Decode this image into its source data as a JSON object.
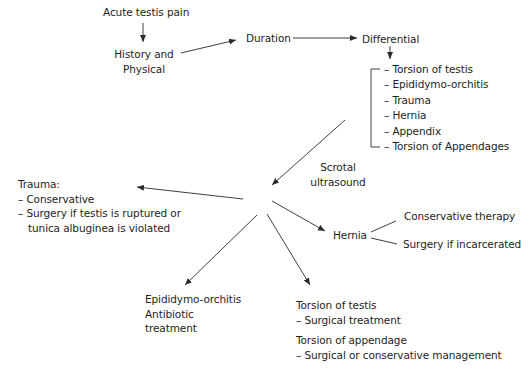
{
  "diagram": {
    "nodes": {
      "start": "Acute testis pain",
      "history_line1": "History and",
      "history_line2": "Physical",
      "duration": "Duration",
      "differential": "Differential",
      "differential_items": [
        "– Torsion of testis",
        "– Epididymo-orchitis",
        "– Trauma",
        "– Hernia",
        "– Appendix",
        "– Torsion of Appendages"
      ],
      "ultrasound_line1": "Scrotal",
      "ultrasound_line2": "ultrasound",
      "trauma": {
        "title": "Trauma:",
        "line1": "– Conservative",
        "line2": "– Surgery if testis is ruptured or",
        "line3": "tunica albuginea is violated"
      },
      "hernia": {
        "label": "Hernia",
        "option1": "Conservative therapy",
        "option2": "Surgery if incarcerated"
      },
      "epididymo": {
        "line1": "Epididymo-orchitis",
        "line2": "Antibiotic",
        "line3": "treatment"
      },
      "torsion_testis": {
        "title": "Torsion of testis",
        "line1": "– Surgical treatment"
      },
      "torsion_appendage": {
        "title": "Torsion of appendage",
        "line1": "– Surgical or conservative management"
      }
    },
    "edges": [
      {
        "from": "Acute testis pain",
        "to": "History and Physical"
      },
      {
        "from": "History and Physical",
        "to": "Duration"
      },
      {
        "from": "Duration",
        "to": "Differential"
      },
      {
        "from": "Differential",
        "to": "Differential list"
      },
      {
        "from": "Differential list",
        "to": "Scrotal ultrasound hub"
      },
      {
        "from": "Scrotal ultrasound hub",
        "to": "Trauma"
      },
      {
        "from": "Scrotal ultrasound hub",
        "to": "Hernia"
      },
      {
        "from": "Scrotal ultrasound hub",
        "to": "Epididymo-orchitis"
      },
      {
        "from": "Scrotal ultrasound hub",
        "to": "Torsion of testis / appendage"
      },
      {
        "from": "Hernia",
        "to": "Conservative therapy"
      },
      {
        "from": "Hernia",
        "to": "Surgery if incarcerated"
      }
    ],
    "colors": {
      "text": "#1e1e1e",
      "line": "#2a2a2a",
      "background": "#ffffff"
    }
  }
}
